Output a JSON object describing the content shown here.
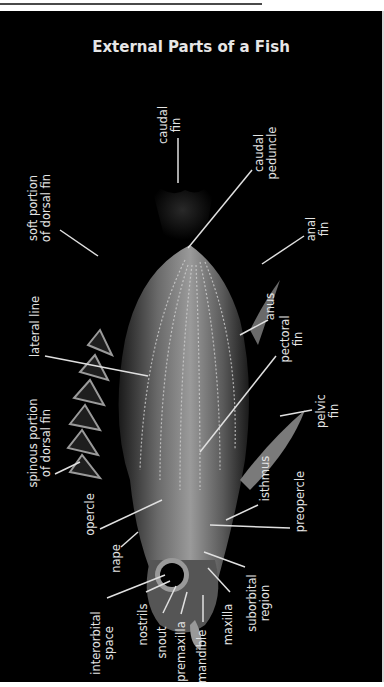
{
  "title": "External Parts of a Fish",
  "colors": {
    "background": "#000000",
    "label": "#e4e4e4",
    "leader": "#e0e0e0",
    "frame_top": "#4a4a4a"
  },
  "labels": [
    {
      "id": "caudal-fin",
      "line1": "caudal",
      "line2": "fin"
    },
    {
      "id": "caudal-peduncle",
      "line1": "caudal",
      "line2": "peduncle"
    },
    {
      "id": "soft-dorsal",
      "line1": "soft portion",
      "line2": "of dorsal fin"
    },
    {
      "id": "anal-fin",
      "line1": "anal",
      "line2": "fin"
    },
    {
      "id": "anus",
      "line1": "anus",
      "line2": ""
    },
    {
      "id": "lateral-line",
      "line1": "lateral line",
      "line2": ""
    },
    {
      "id": "pectoral-fin",
      "line1": "pectoral",
      "line2": "fin"
    },
    {
      "id": "pelvic-fin",
      "line1": "pelvic",
      "line2": "fin"
    },
    {
      "id": "spinous-dorsal",
      "line1": "spinous portion",
      "line2": "of dorsal fin"
    },
    {
      "id": "isthmus",
      "line1": "isthmus",
      "line2": ""
    },
    {
      "id": "opercle",
      "line1": "opercle",
      "line2": ""
    },
    {
      "id": "preopercle",
      "line1": "preopercle",
      "line2": ""
    },
    {
      "id": "nape",
      "line1": "nape",
      "line2": ""
    },
    {
      "id": "suborbital",
      "line1": "suborbital",
      "line2": "region"
    },
    {
      "id": "interorbital",
      "line1": "interorbital",
      "line2": "space"
    },
    {
      "id": "nostrils",
      "line1": "nostrils",
      "line2": ""
    },
    {
      "id": "snout",
      "line1": "snout",
      "line2": ""
    },
    {
      "id": "premaxilla",
      "line1": "premaxilla",
      "line2": ""
    },
    {
      "id": "mandible",
      "line1": "mandible",
      "line2": ""
    },
    {
      "id": "maxilla",
      "line1": "maxilla",
      "line2": ""
    }
  ]
}
